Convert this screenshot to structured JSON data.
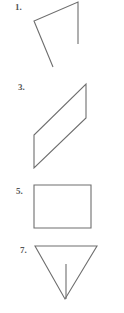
{
  "figures": [
    {
      "label": "1.",
      "type": "open-polyline",
      "points": "53,67 34,21 78,2 78,44"
    },
    {
      "label": "3.",
      "type": "parallelogram",
      "points": "86,9 86,43 34,93 34,60",
      "offset_y": 75
    },
    {
      "label": "5.",
      "type": "rectangle",
      "points": "34,15 91,15 91,58 34,58",
      "offset_y": 170
    },
    {
      "label": "7.",
      "type": "triangle-with-segment",
      "points": "35,16 97,16 65,69",
      "segment": "66,34 66,69",
      "offset_y": 230
    }
  ],
  "colors": {
    "stroke": "#6e6e6e",
    "label": "#555555",
    "background": "#ffffff"
  }
}
